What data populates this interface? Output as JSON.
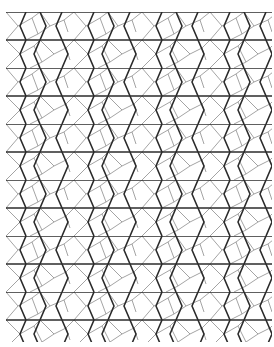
{
  "image": {
    "description": "Monochrome geometric tiling of thick dark edges and thin gray edges forming hexagons, pentagons and triangles",
    "width": 274,
    "height": 347,
    "colors": {
      "background": "#ffffff",
      "thick_line": "#2a2a2a",
      "thin_line": "#8c8c8c"
    },
    "stroke": {
      "thick": 1.6,
      "thin": 0.8
    },
    "tile": {
      "width": 68,
      "height": 56,
      "margin_left": 6,
      "margin_top": 12
    }
  }
}
